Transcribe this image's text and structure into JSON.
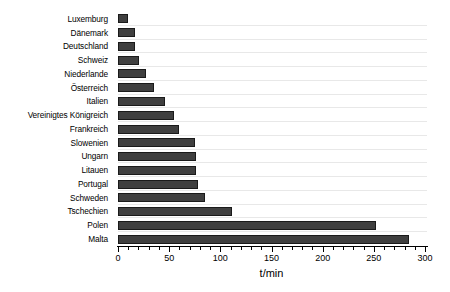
{
  "chart_data": {
    "type": "bar",
    "orientation": "horizontal",
    "title": "",
    "xlabel": "t/min",
    "ylabel": "",
    "xlim": [
      0,
      300
    ],
    "ylim": null,
    "grid": "horizontal",
    "legend": null,
    "xticks": [
      0,
      50,
      100,
      150,
      200,
      250,
      300
    ],
    "xtick_labels": [
      "0",
      "50",
      "100",
      "150",
      "200",
      "250",
      "300"
    ],
    "minor_tick_step": 10,
    "bar_color": "#3f3f3f",
    "bar_edge_color": "#1a1a1a",
    "grid_color": "#e8e8e8",
    "categories": [
      "Luxemburg",
      "Dänemark",
      "Deutschland",
      "Schweiz",
      "Niederlande",
      "Österreich",
      "Italien",
      "Vereinigtes Königreich",
      "Frankreich",
      "Slowenien",
      "Ungarn",
      "Litauen",
      "Portugal",
      "Schweden",
      "Tschechien",
      "Polen",
      "Malta"
    ],
    "values": [
      10,
      17,
      17,
      21,
      27,
      35,
      46,
      55,
      60,
      75,
      76,
      76,
      78,
      85,
      111,
      252,
      284
    ]
  }
}
